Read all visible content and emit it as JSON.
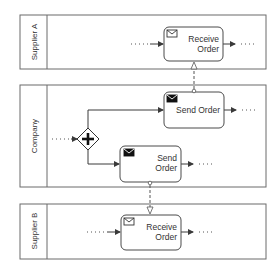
{
  "diagram": {
    "type": "BPMN collaboration",
    "colors": {
      "stroke": "#4a4a4a",
      "background": "#ffffff",
      "text": "#333333"
    },
    "pools": [
      {
        "id": "supplier_a",
        "label": "Supplier A"
      },
      {
        "id": "company",
        "label": "Company"
      },
      {
        "id": "supplier_b",
        "label": "Supplier B"
      }
    ],
    "tasks": [
      {
        "id": "receive_a",
        "pool": "supplier_a",
        "line1": "Receive",
        "line2": "Order",
        "icon": "envelope-outline-icon",
        "kind": "receive-task"
      },
      {
        "id": "send_top",
        "pool": "company",
        "line1": "Send Order",
        "icon": "envelope-filled-icon",
        "kind": "send-task"
      },
      {
        "id": "send_bottom",
        "pool": "company",
        "line1": "Send",
        "line2": "Order",
        "icon": "envelope-filled-icon",
        "kind": "send-task"
      },
      {
        "id": "receive_b",
        "pool": "supplier_b",
        "line1": "Receive",
        "line2": "Order",
        "icon": "envelope-outline-icon",
        "kind": "receive-task"
      }
    ],
    "gateway": {
      "id": "parallel_gateway",
      "pool": "company",
      "type": "parallel",
      "symbol": "+"
    },
    "message_flows": [
      {
        "from": "send_top",
        "to": "receive_a"
      },
      {
        "from": "send_bottom",
        "to": "receive_b"
      }
    ],
    "continuation": "..."
  }
}
